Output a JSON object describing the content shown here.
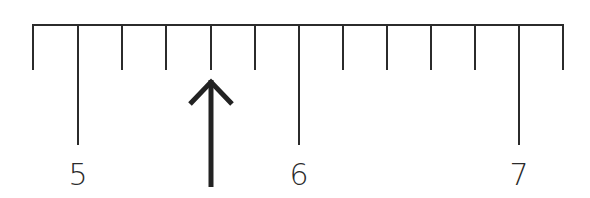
{
  "diagram": {
    "type": "ruler-scale",
    "line_color": "#2b2b2b",
    "baseline": {
      "x_start": 33,
      "x_end": 563,
      "y": 25
    },
    "tick_spacing_px": 44.2,
    "minor_ticks_per_unit": 5,
    "major_labels": [
      {
        "value": "5",
        "x": 78
      },
      {
        "value": "6",
        "x": 299
      },
      {
        "value": "7",
        "x": 519
      }
    ],
    "ticks": [
      {
        "x": 33,
        "kind": "minor",
        "value": 4.8
      },
      {
        "x": 78,
        "kind": "major",
        "value": 5.0
      },
      {
        "x": 122,
        "kind": "minor",
        "value": 5.2
      },
      {
        "x": 166,
        "kind": "minor",
        "value": 5.4
      },
      {
        "x": 211,
        "kind": "minor",
        "value": 5.6
      },
      {
        "x": 255,
        "kind": "minor",
        "value": 5.8
      },
      {
        "x": 299,
        "kind": "major",
        "value": 6.0
      },
      {
        "x": 343,
        "kind": "minor",
        "value": 6.2
      },
      {
        "x": 387,
        "kind": "minor",
        "value": 6.4
      },
      {
        "x": 431,
        "kind": "minor",
        "value": 6.6
      },
      {
        "x": 475,
        "kind": "minor",
        "value": 6.8
      },
      {
        "x": 519,
        "kind": "major",
        "value": 7.0
      },
      {
        "x": 563,
        "kind": "minor",
        "value": 7.2
      }
    ],
    "pointer": {
      "icon": "arrow-up-icon",
      "x": 211,
      "tip_y": 78,
      "tail_y": 187,
      "points_to_value": 5.6
    }
  }
}
